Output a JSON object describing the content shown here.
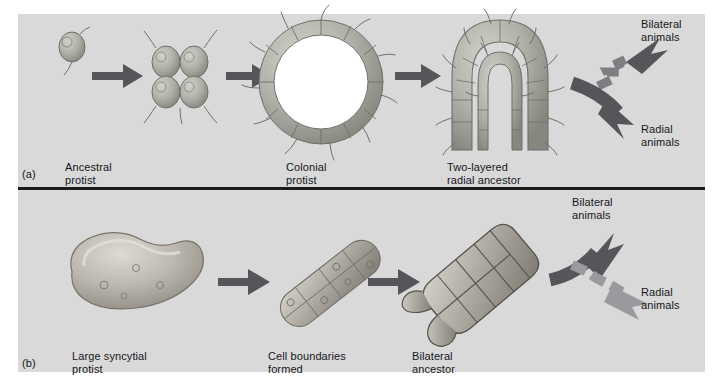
{
  "figure": {
    "background_color": "#d9d9d9",
    "page_color": "#ffffff",
    "divider_color": "#1c1c1c",
    "arrow_color_dark": "#55555a",
    "arrow_color_light": "#9a9a9e",
    "cell_fill": "#b9b9b3",
    "cell_stroke": "#6f6f6c",
    "hollow_fill": "#ffffff"
  },
  "panels": [
    {
      "id": "a",
      "label": "(a)",
      "hypothesis": "colonial-protist hypothesis",
      "stages": [
        {
          "name": "ancestral-protist",
          "caption": "Ancestral\nprotist"
        },
        {
          "name": "aggregate-of-protists",
          "caption": ""
        },
        {
          "name": "colonial-protist",
          "caption": "Colonial\nprotist"
        },
        {
          "name": "two-layered-radial-ancestor",
          "caption": "Two-layered\nradial ancestor"
        }
      ],
      "outcomes": [
        {
          "name": "bilateral-animals",
          "label": "Bilateral\nanimals",
          "arrow_style": "dashed",
          "direction": "up"
        },
        {
          "name": "radial-animals",
          "label": "Radial\nanimals",
          "arrow_style": "solid",
          "direction": "down"
        }
      ]
    },
    {
      "id": "b",
      "label": "(b)",
      "hypothesis": "syncytial-ciliate hypothesis",
      "stages": [
        {
          "name": "large-syncytial-protist",
          "caption": "Large syncytial\nprotist"
        },
        {
          "name": "cell-boundaries-formed",
          "caption": "Cell boundaries\nformed"
        },
        {
          "name": "bilateral-ancestor",
          "caption": "Bilateral\nancestor"
        }
      ],
      "outcomes": [
        {
          "name": "bilateral-animals",
          "label": "Bilateral\nanimals",
          "arrow_style": "solid",
          "direction": "up"
        },
        {
          "name": "radial-animals",
          "label": "Radial\nanimals",
          "arrow_style": "dashed",
          "direction": "down"
        }
      ]
    }
  ]
}
